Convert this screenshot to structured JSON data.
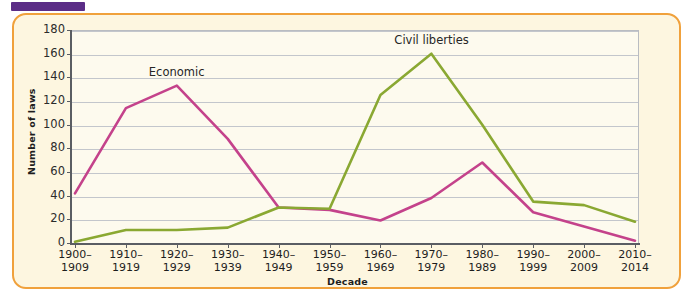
{
  "figure": {
    "tab_marker": "",
    "frame_color": "#f0a13c",
    "panel_color": "#fdf6e0",
    "plot_bg_color": "#fdfaee"
  },
  "chart_data": {
    "type": "line",
    "title": "",
    "xlabel": "Decade",
    "ylabel": "Number of laws",
    "ylim": [
      0,
      180
    ],
    "ytick_step": 20,
    "yticks": [
      0,
      20,
      40,
      60,
      80,
      100,
      120,
      140,
      160,
      180
    ],
    "ytick_labels": [
      "0",
      "20",
      "40",
      "60",
      "80",
      "100",
      "120",
      "140",
      "160",
      "180"
    ],
    "grid": true,
    "legend": "inline-annotations",
    "categories": [
      "1900–\n1909",
      "1910–\n1919",
      "1920–\n1929",
      "1930–\n1939",
      "1940–\n1949",
      "1950–\n1959",
      "1960–\n1969",
      "1970–\n1979",
      "1980–\n1989",
      "1990–\n1999",
      "2000–\n2009",
      "2010–\n2014"
    ],
    "category_lines": [
      [
        "1900–",
        "1909"
      ],
      [
        "1910–",
        "1919"
      ],
      [
        "1920–",
        "1929"
      ],
      [
        "1930–",
        "1939"
      ],
      [
        "1940–",
        "1949"
      ],
      [
        "1950–",
        "1959"
      ],
      [
        "1960–",
        "1969"
      ],
      [
        "1970–",
        "1979"
      ],
      [
        "1980–",
        "1989"
      ],
      [
        "1990–",
        "1999"
      ],
      [
        "2000–",
        "2009"
      ],
      [
        "2010–",
        "2014"
      ]
    ],
    "series": [
      {
        "name": "Economic",
        "color": "#c4428b",
        "label_x_index": 2,
        "values": [
          42,
          114,
          133,
          88,
          30,
          28,
          19,
          38,
          68,
          26,
          14,
          2
        ]
      },
      {
        "name": "Civil liberties",
        "color": "#8aa832",
        "label_x_index": 7,
        "values": [
          1,
          11,
          11,
          13,
          30,
          29,
          125,
          160,
          100,
          35,
          32,
          18
        ]
      }
    ]
  }
}
